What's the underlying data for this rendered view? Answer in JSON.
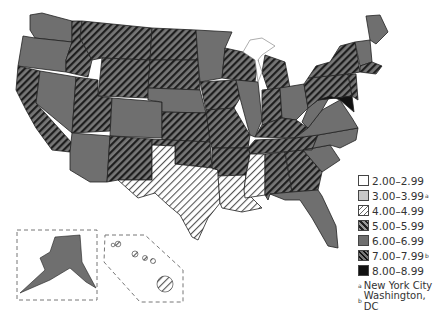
{
  "map": {
    "title": "",
    "region": "United States",
    "colors": {
      "border": "#222222",
      "solid_gray": "#6f6f6f",
      "light_gray": "#c8c8c8",
      "black": "#111111",
      "white": "#ffffff"
    }
  },
  "legend": {
    "items": [
      {
        "label": "2.00–2.99",
        "pattern": "white",
        "note": ""
      },
      {
        "label": "3.00–3.99",
        "pattern": "light-gray",
        "note": "a"
      },
      {
        "label": "4.00–4.99",
        "pattern": "light-hatch",
        "note": ""
      },
      {
        "label": "5.00–5.99",
        "pattern": "medium-hatch",
        "note": ""
      },
      {
        "label": "6.00–6.99",
        "pattern": "solid-gray",
        "note": ""
      },
      {
        "label": "7.00–7.99",
        "pattern": "dark-hatch",
        "note": "b"
      },
      {
        "label": "8.00–8.99",
        "pattern": "black",
        "note": ""
      }
    ],
    "footnotes": [
      {
        "mark": "a",
        "text": "New York City"
      },
      {
        "mark": "b",
        "text": "Washington, DC"
      }
    ]
  },
  "insets": {
    "alaska": "Alaska",
    "hawaii": "Hawaii"
  }
}
